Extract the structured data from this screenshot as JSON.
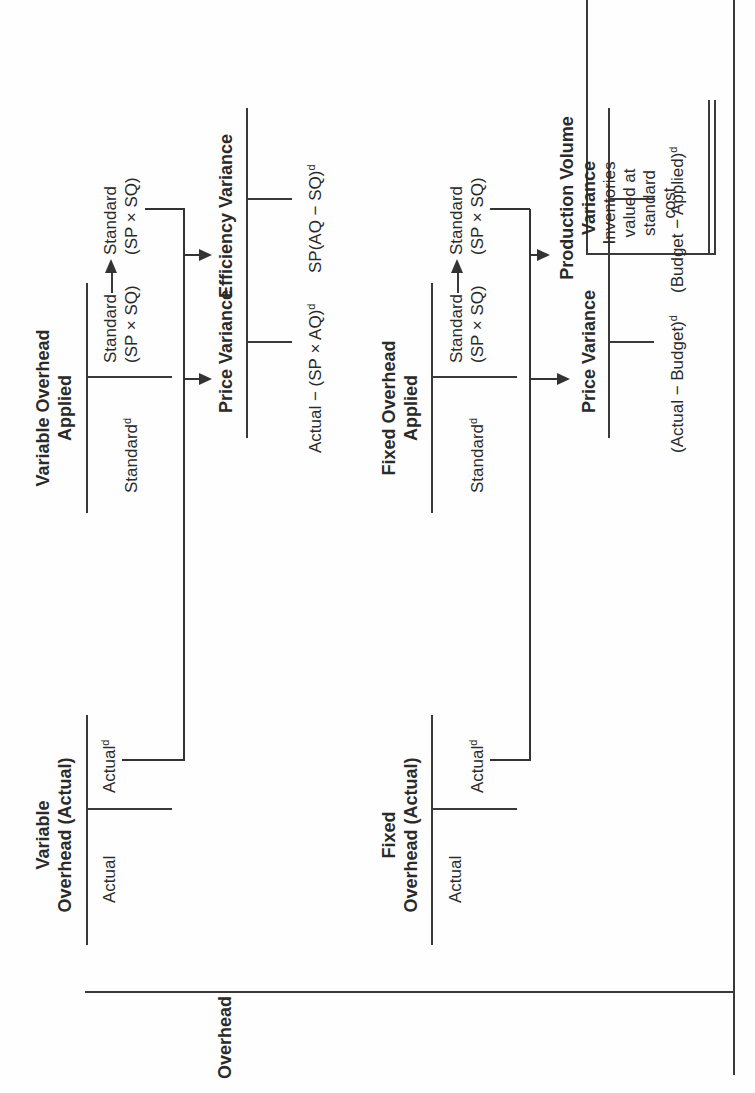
{
  "row_label": "Overhead",
  "variable": {
    "actual_account": {
      "title_line1": "Variable",
      "title_line2": "Overhead (Actual)",
      "debit": "Actual",
      "credit": "Actual",
      "credit_sup": "d"
    },
    "applied_account": {
      "title_line1": "Variable Overhead",
      "title_line2": "Applied",
      "debit": "Standard",
      "debit_sup": "d",
      "credit_line1": "Standard",
      "credit_line2": "(SP × SQ)"
    },
    "price_variance": {
      "title": "Price Variance",
      "formula": "Actual − (SP × AQ)",
      "formula_sup": "d"
    },
    "efficiency_variance": {
      "title": "Efficiency Variance",
      "formula": "SP(AQ − SQ)",
      "formula_sup": "d"
    },
    "destination": {
      "line1": "Standard",
      "line2": "(SP × SQ)"
    }
  },
  "fixed": {
    "actual_account": {
      "title_line1": "Fixed",
      "title_line2": "Overhead (Actual)",
      "debit": "Actual",
      "credit": "Actual",
      "credit_sup": "d"
    },
    "applied_account": {
      "title_line1": "Fixed Overhead",
      "title_line2": "Applied",
      "debit": "Standard",
      "debit_sup": "d",
      "credit_line1": "Standard",
      "credit_line2": "(SP × SQ)"
    },
    "price_variance": {
      "title": "Price Variance",
      "formula": "(Actual − Budget)",
      "formula_sup": "d"
    },
    "production_volume_variance": {
      "title_line1": "Production Volume",
      "title_line2": "Variance",
      "formula": "(Budget − Applied)",
      "formula_sup": "d"
    },
    "destination": {
      "line1": "Standard",
      "line2": "(SP × SQ)"
    }
  },
  "inventory_column": {
    "line1": "Inventories",
    "line2": "valued at",
    "line3": "standard",
    "line4": "cost"
  },
  "colors": {
    "ink": "#2a2a2a",
    "paper": "#fefefe"
  }
}
